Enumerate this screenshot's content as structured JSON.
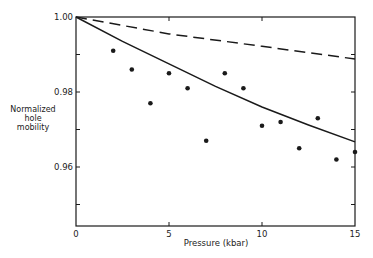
{
  "chart_data": {
    "type": "scatter",
    "title": "",
    "xlabel": "Pressure (kbar)",
    "ylabel": [
      "Normalized",
      "hole",
      "mobility"
    ],
    "xlim": [
      0,
      15
    ],
    "ylim": [
      0.944,
      1.0
    ],
    "x_ticks": [
      0,
      5,
      10,
      15
    ],
    "x_tick_labels": [
      "0",
      "5",
      "10",
      "15"
    ],
    "y_ticks": [
      0.95,
      0.96,
      0.97,
      0.98,
      0.99,
      1.0
    ],
    "y_tick_labels": [
      "",
      "0.96",
      "",
      "0.98",
      "",
      "1.00"
    ],
    "grid": false,
    "legend": null,
    "series": [
      {
        "name": "measured",
        "kind": "scatter",
        "marker": "filled-circle",
        "x": [
          2,
          3,
          4,
          5,
          6,
          7,
          8,
          9,
          10,
          11,
          12,
          13,
          14,
          15
        ],
        "y": [
          0.991,
          0.986,
          0.977,
          0.985,
          0.981,
          0.967,
          0.985,
          0.981,
          0.971,
          0.972,
          0.965,
          0.973,
          0.962,
          0.964
        ]
      },
      {
        "name": "theory-solid",
        "kind": "line",
        "style": "solid",
        "x": [
          0,
          2.5,
          5,
          7.5,
          10,
          12.5,
          15
        ],
        "y": [
          1.0,
          0.9935,
          0.9875,
          0.9815,
          0.976,
          0.9712,
          0.9667
        ]
      },
      {
        "name": "theory-dashed",
        "kind": "line",
        "style": "dashed",
        "x": [
          0,
          5,
          10,
          15
        ],
        "y": [
          1.0,
          0.9955,
          0.9922,
          0.9888
        ]
      }
    ]
  },
  "labels": {
    "xlabel": "Pressure (kbar)",
    "ylabel_lines": [
      "Normalized",
      "hole",
      "mobility"
    ]
  },
  "colors": {
    "ink": "#1a1a1a",
    "background": "#ffffff"
  }
}
